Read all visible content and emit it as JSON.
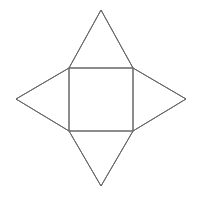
{
  "figure": {
    "background_color": "#ffffff",
    "stroke_color": "#666666",
    "stroke_width": 1,
    "canvas": {
      "width": 199,
      "height": 197
    },
    "square": {
      "name": "central-square",
      "left": 69,
      "top": 68,
      "right": 133,
      "bottom": 131,
      "width": 64,
      "height": 63,
      "corners": {
        "top_left": [
          69,
          68
        ],
        "top_right": [
          133,
          68
        ],
        "bottom_right": [
          133,
          131
        ],
        "bottom_left": [
          69,
          131
        ]
      }
    },
    "triangles": [
      {
        "name": "top-triangle",
        "apex": [
          101,
          10
        ],
        "base": [
          [
            69,
            68
          ],
          [
            133,
            68
          ]
        ],
        "points": "69,68 101,10 133,68"
      },
      {
        "name": "right-triangle",
        "apex": [
          186,
          99
        ],
        "base": [
          [
            133,
            68
          ],
          [
            133,
            131
          ]
        ],
        "points": "133,68 186,99 133,131"
      },
      {
        "name": "bottom-triangle",
        "apex": [
          101,
          186
        ],
        "base": [
          [
            133,
            131
          ],
          [
            69,
            131
          ]
        ],
        "points": "133,131 101,186 69,131"
      },
      {
        "name": "left-triangle",
        "apex": [
          16,
          99
        ],
        "base": [
          [
            69,
            131
          ],
          [
            69,
            68
          ]
        ],
        "points": "69,131 16,99 69,68"
      }
    ],
    "outline_points": "101,10 133,68 186,99 133,131 101,186 69,131 16,99 69,68 101,10"
  }
}
